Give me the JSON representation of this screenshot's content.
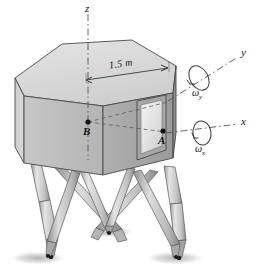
{
  "figure": {
    "background_color": "#ffffff"
  },
  "axes": [
    {
      "id": "z",
      "label": "z",
      "style": "dash-dot",
      "direction": "up"
    },
    {
      "id": "y",
      "label": "y",
      "style": "dash-dot",
      "direction": "upper-right"
    },
    {
      "id": "x",
      "label": "x",
      "style": "dash-dot",
      "direction": "right"
    }
  ],
  "angular_velocities": [
    {
      "id": "omega-y",
      "symbol": "ω",
      "subscript": "y",
      "about_axis": "y"
    },
    {
      "id": "omega-x",
      "symbol": "ω",
      "subscript": "x",
      "about_axis": "x"
    }
  ],
  "points": [
    {
      "id": "B",
      "label": "B",
      "location": "center of body interior"
    },
    {
      "id": "A",
      "label": "A",
      "location": "lower edge of window panel"
    }
  ],
  "dimensions": [
    {
      "id": "width",
      "label": "1.5 m",
      "value": 1.5,
      "unit": "m",
      "measures": "top face edge span"
    }
  ],
  "colors": {
    "body_top": "#d8d8d8",
    "body_left": "#cfcfcf",
    "body_front": "#b9b9b9",
    "body_right_dark": "#9b9b9b",
    "window_glass": "#e8e8e8",
    "window_frame": "#a8a8a8",
    "leg": "#cccccc",
    "leg_shade": "#8f8f8f",
    "outline": "#4a4a4a",
    "axis_line": "#555555",
    "shadow": "#bbbbbb",
    "text": "#111111"
  },
  "structure": {
    "body_shape": "hexagonal prism",
    "leg_count": 4,
    "leg_style": "telescoping strut with conical foot pad",
    "ground_shadows": 3
  }
}
